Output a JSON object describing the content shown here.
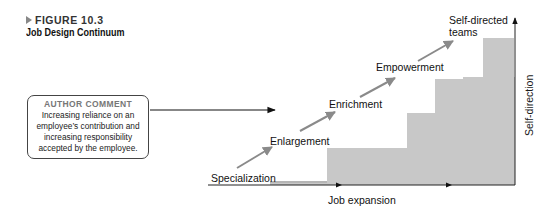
{
  "figure": {
    "number": "FIGURE 10.3",
    "title": "Job Design Continuum"
  },
  "author_comment": {
    "heading": "AUTHOR COMMENT",
    "lines": [
      "Increasing reliance on an",
      "employee’s contribution and",
      "increasing responsibility",
      "accepted by the employee."
    ]
  },
  "diagram": {
    "x_axis_label": "Job expansion",
    "y_axis_label": "Self-direction",
    "steps": [
      {
        "label": "Specialization"
      },
      {
        "label": "Enlargement"
      },
      {
        "label": "Enrichment"
      },
      {
        "label": "Empowerment"
      },
      {
        "label": "Self-directed",
        "label2": "teams"
      }
    ],
    "colors": {
      "staircase_fill": "#c8c8c8",
      "step_arrow": "#8a8a8a",
      "axis": "#222222"
    }
  }
}
